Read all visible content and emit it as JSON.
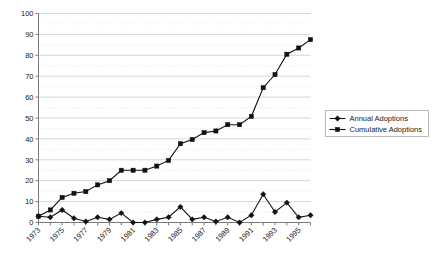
{
  "chart_data": {
    "type": "line",
    "title": "",
    "xlabel": "",
    "ylabel": "",
    "ylim": [
      0,
      100
    ],
    "ytick_step": 10,
    "yticks": [
      0,
      10,
      20,
      30,
      40,
      50,
      60,
      70,
      80,
      90,
      100
    ],
    "grid": true,
    "grid_style": "horizontal-major-plus-dotted-minor",
    "legend_position": "right-middle",
    "x": [
      1973,
      1974,
      1975,
      1976,
      1977,
      1978,
      1979,
      1980,
      1981,
      1982,
      1983,
      1984,
      1985,
      1986,
      1987,
      1988,
      1989,
      1990,
      1991,
      1992,
      1993,
      1994,
      1995,
      1996
    ],
    "xtick_labels": [
      "1973",
      "1975",
      "1977",
      "1979",
      "1981",
      "1983",
      "1985",
      "1987",
      "1989",
      "1991",
      "1993",
      "1995"
    ],
    "xtick_values": [
      1973,
      1975,
      1977,
      1979,
      1981,
      1983,
      1985,
      1987,
      1989,
      1991,
      1993,
      1995
    ],
    "series": [
      {
        "name": "Annual Adoptions",
        "marker": "diamond",
        "color": "#111111",
        "values": [
          3,
          2.5,
          6,
          2,
          0.5,
          2.5,
          1.5,
          4.5,
          0,
          0,
          1.5,
          2.5,
          7.5,
          1.5,
          2.5,
          0.5,
          2.5,
          0,
          3.5,
          13.5,
          5,
          9.5,
          2.5,
          3.5
        ]
      },
      {
        "name": "Cumulative Adoptions",
        "marker": "square",
        "color": "#111111",
        "values": [
          3,
          6,
          12,
          14,
          14.8,
          18,
          20,
          25,
          25,
          25,
          27,
          29.7,
          37.7,
          39.7,
          43,
          43.8,
          46.8,
          46.8,
          50.8,
          64.5,
          70.8,
          80.5,
          83.5,
          87.5
        ]
      }
    ]
  },
  "legend": {
    "items": [
      {
        "label": "Annual Adoptions",
        "marker": "diamond"
      },
      {
        "label": "Cumulative Adoptions",
        "marker": "square"
      }
    ]
  }
}
